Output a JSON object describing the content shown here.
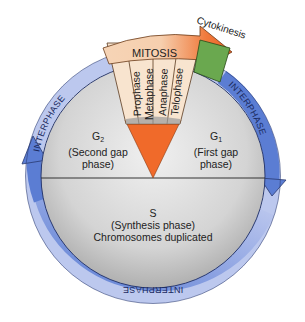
{
  "diagram": {
    "colors": {
      "ring_light": "#bcc8ee",
      "ring_dark": "#5b7dd3",
      "ring_border": "#2a3a70",
      "disc_light": "#e8e8e8",
      "disc_dark": "#b9b9b9",
      "mitosis_band": "#f6d9bd",
      "mitosis_arrow": "#f07030",
      "phase_cells": "#f8e4cf",
      "wedge": "#f06a2a",
      "cytokinesis": "#6aa84f"
    },
    "mitosis": {
      "label": "MITOSIS",
      "phases": [
        "Prophase",
        "Metaphase",
        "Anaphase",
        "Telophase"
      ]
    },
    "cytokinesis": {
      "label": "Cytokinesis"
    },
    "ring_labels": {
      "left": "INTERPHASE",
      "right": "INTERPHASE",
      "bottom": "INTERPHASE"
    },
    "g2": {
      "symbol": "G",
      "sub": "2",
      "line1": "(Second gap",
      "line2": "phase)"
    },
    "g1": {
      "symbol": "G",
      "sub": "1",
      "line1": "(First gap",
      "line2": "phase)"
    },
    "s": {
      "symbol": "S",
      "line1": "(Synthesis phase)",
      "line2": "Chromosomes duplicated"
    }
  }
}
